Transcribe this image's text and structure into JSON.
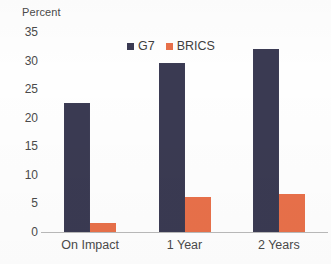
{
  "chart_data": {
    "type": "bar",
    "title": "",
    "xlabel": "",
    "ylabel": "Percent",
    "categories": [
      "On Impact",
      "1 Year",
      "2 Years"
    ],
    "series": [
      {
        "name": "G7",
        "color": "#3a3a52",
        "values": [
          22.5,
          29.5,
          32.0
        ]
      },
      {
        "name": "BRICS",
        "color": "#e8704a",
        "values": [
          1.6,
          6.1,
          6.7
        ]
      }
    ],
    "ylim": [
      0,
      35
    ],
    "yticks": [
      0,
      5,
      10,
      15,
      20,
      25,
      30,
      35
    ],
    "ytick_labels": [
      "0",
      "5",
      "10",
      "15",
      "20",
      "25",
      "30",
      "35"
    ],
    "grid": false,
    "legend_position": "top-center",
    "legend": [
      "G7",
      "BRICS"
    ]
  },
  "axis": {
    "y_title": "Percent"
  },
  "legend": {
    "items": [
      {
        "label": "G7",
        "swatch": "legend-swatch-g7"
      },
      {
        "label": "BRICS",
        "swatch": "legend-swatch-brics"
      }
    ]
  }
}
